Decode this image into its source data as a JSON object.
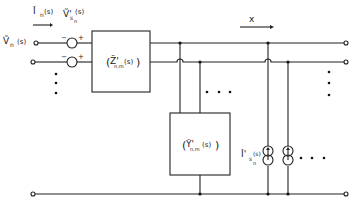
{
  "diagram": {
    "type": "circuit-network",
    "labels": {
      "input_voltage": "Ṽn (s)",
      "input_voltage_main": "Ṽ",
      "input_voltage_sub": "n",
      "input_voltage_arg": "(s)",
      "input_current_main": "Ĩ",
      "input_current_sub": "n",
      "input_current_arg": "(s)",
      "source_voltage_main": "Ṽ'",
      "source_voltage_sub": "s",
      "source_voltage_subsub": "n",
      "source_voltage_arg": "(s)",
      "impedance_matrix_main": "Z̃'",
      "impedance_matrix_sub": "n,m",
      "impedance_matrix_arg": "(s)",
      "admittance_matrix_main": "Ỹ'",
      "admittance_matrix_sub": "n,m",
      "admittance_matrix_arg": "(s)",
      "source_current_main": "Ĩ'",
      "source_current_sub": "s",
      "source_current_subsub": "n",
      "source_current_arg": "(s)",
      "position_axis": "x",
      "minus": "−",
      "plus": "+",
      "paren_open": "(",
      "paren_close": ")",
      "ellipsis_dots": "• • •"
    },
    "icons": {
      "voltage_source": "voltage-source-icon",
      "current_source": "current-source-icon",
      "terminal": "terminal-icon",
      "junction": "junction-dot-icon"
    }
  }
}
